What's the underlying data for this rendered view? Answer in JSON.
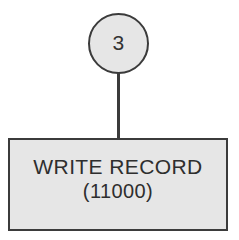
{
  "diagram": {
    "type": "flowchart-fragment",
    "background_color": "#ffffff",
    "shape_fill_color": "#e6e6e6",
    "shape_border_color": "#3b3b3b",
    "text_color": "#2e2e2e",
    "connector_node": {
      "shape": "circle",
      "label": "3"
    },
    "connector_line": {
      "orientation": "vertical"
    },
    "process_box": {
      "shape": "rectangle",
      "title": "WRITE RECORD",
      "subtitle": "(11000)"
    }
  }
}
